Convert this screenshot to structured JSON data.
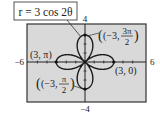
{
  "chart_data": {
    "type": "line",
    "subtype": "polar-rose",
    "title": "r = 3 cos 2θ",
    "equation": "r = 3 cos 2θ",
    "xlim": [
      -6,
      6
    ],
    "ylim": [
      -4,
      4
    ],
    "xtick_labels": {
      "min": "−6",
      "max": "6"
    },
    "ytick_labels": {
      "min": "−4",
      "max": "4"
    },
    "grid": false,
    "xlabel": "",
    "ylabel": "",
    "series": [
      {
        "name": "r = 3 cos 2θ",
        "amplitude": 3,
        "k": 2,
        "petals": 4
      }
    ],
    "annotated_points": [
      {
        "label": "(3, 0)",
        "r": 3,
        "theta": "0",
        "x": 3,
        "y": 0
      },
      {
        "label": "(3, π)",
        "r": 3,
        "theta": "π",
        "x": -3,
        "y": 0
      },
      {
        "label": "(−3, π/2)",
        "r": -3,
        "theta": "π/2",
        "x": 0,
        "y": -3
      },
      {
        "label": "(−3, 3π/2)",
        "r": -3,
        "theta": "3π/2",
        "x": 0,
        "y": 3
      }
    ]
  },
  "labels": {
    "equation": "r = 3 cos 2θ",
    "xmin": "−6",
    "xmax": "6",
    "ymin": "−4",
    "ymax": "4",
    "p_right": "(3, 0)",
    "p_left": "(3, π)",
    "p_bottom_r": "(−3,",
    "p_bottom_num": "π",
    "p_bottom_den": "2",
    "p_top_r": "(−3,",
    "p_top_num": "3π",
    "p_top_den": "2"
  },
  "colors": {
    "plot_background": "#d9d9d9",
    "curve": "#1a1a1a",
    "border": "#333333"
  }
}
